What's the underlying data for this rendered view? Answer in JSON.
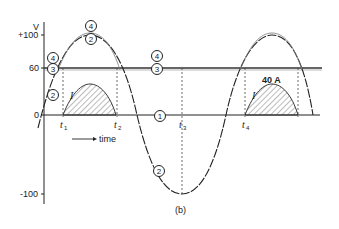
{
  "figure": {
    "caption": "(b)",
    "y_axis_label": "V",
    "y_ticks": [
      {
        "label": "+100",
        "value": 100
      },
      {
        "label": "60",
        "value": 60
      },
      {
        "label": "0",
        "value": 0
      },
      {
        "label": "-100",
        "value": -100
      }
    ],
    "time_labels": [
      {
        "main": "t",
        "sub": "1"
      },
      {
        "main": "t",
        "sub": "2"
      },
      {
        "main": "t",
        "sub": "3"
      },
      {
        "main": "t",
        "sub": "4"
      }
    ],
    "time_arrow_label": "time",
    "current_label": "I",
    "current_peak_label": "40 A",
    "curve_markers": {
      "m1": "1",
      "m2": "2",
      "m3": "3",
      "m4": "4"
    }
  },
  "colors": {
    "line": "#222222",
    "hatch": "#555555",
    "background": "#ffffff"
  }
}
